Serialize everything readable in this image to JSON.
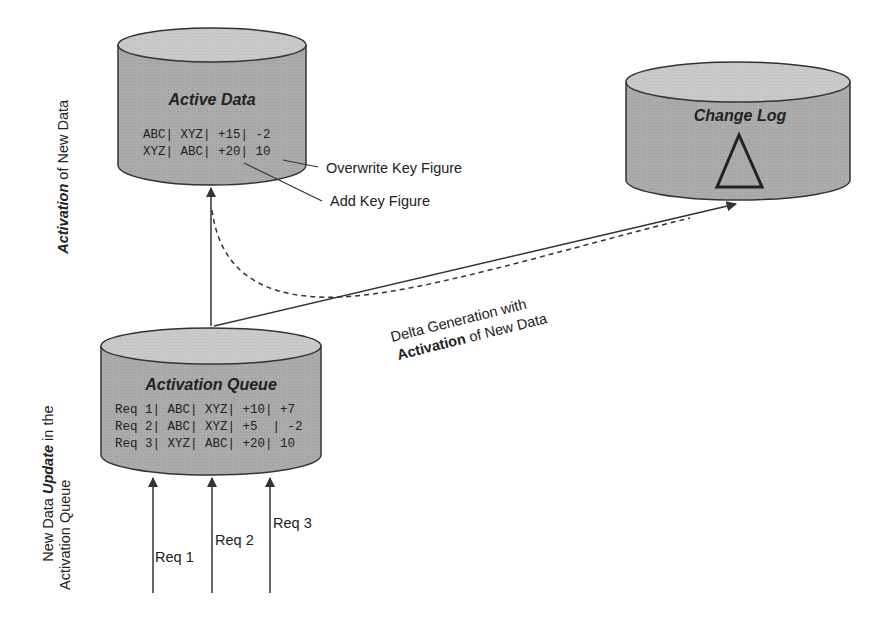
{
  "diagram": {
    "active_data": {
      "title": "Active Data",
      "rows": [
        "ABC| XYZ| +15| -2",
        "XYZ| ABC| +20| 10"
      ],
      "callouts": [
        "Overwrite Key Figure",
        "Add Key Figure"
      ]
    },
    "change_log": {
      "title": "Change Log",
      "symbol": "delta-icon"
    },
    "activation_queue": {
      "title": "Activation Queue",
      "rows": [
        "Req 1| ABC| XYZ| +10| +7",
        "Req 2| ABC| XYZ| +5  | -2",
        "Req 3| XYZ| ABC| +20| 10"
      ]
    },
    "requests": [
      "Req 1",
      "Req 2",
      "Req 3"
    ],
    "delta_label": {
      "line1": "Delta Generation with",
      "line2_bold": "Activation",
      "line2_rest": " of New Data"
    },
    "side_label_top": {
      "bold_italic": "Activation",
      "rest": " of New Data"
    },
    "side_label_bottom": {
      "prefix": "New Data ",
      "bold_italic": "Update",
      "suffix": " in the",
      "line2": "Activation Queue"
    },
    "colors": {
      "cylinder_body": "#a9a9a9",
      "cylinder_top": "#c8c8c8",
      "outline": "#333333"
    }
  }
}
